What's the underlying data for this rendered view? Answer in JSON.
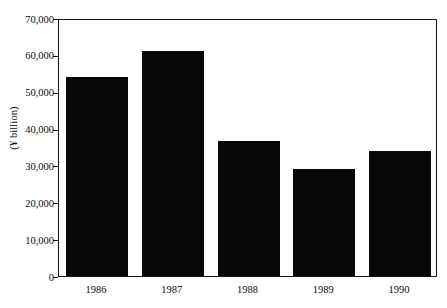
{
  "chart_data": {
    "type": "bar",
    "title": "",
    "subtitle": "",
    "xlabel": "",
    "ylabel": "(¥ billion)",
    "categories": [
      "1986",
      "1987",
      "1988",
      "1989",
      "1990"
    ],
    "values": [
      54000,
      61000,
      36500,
      29000,
      34000
    ],
    "ylim": [
      0,
      70000
    ],
    "y_ticks": [
      0,
      10000,
      20000,
      30000,
      40000,
      50000,
      60000,
      70000
    ],
    "y_tick_labels": [
      "0",
      "10,000",
      "20,000",
      "30,000",
      "40,000",
      "50,000",
      "60,000",
      "70,000"
    ],
    "grid": false,
    "legend": false,
    "legend_position": "none",
    "bar_color": "#080808",
    "frame_color": "#141414",
    "background_color": "#ffffff"
  }
}
